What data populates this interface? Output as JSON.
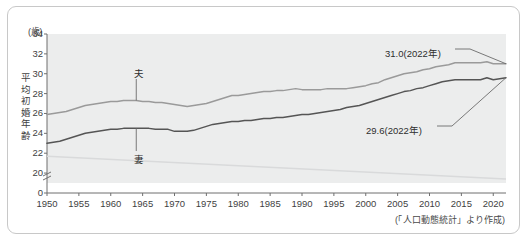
{
  "figure": {
    "unit_label": "(歳)",
    "y_axis_title_chars": [
      "平",
      "均",
      "初",
      "婚",
      "年",
      "齢"
    ],
    "source_note": "(「人口動態統計」より作成)"
  },
  "annotations": {
    "husband_end": "31.0(2022年)",
    "wife_end": "29.6(2022年)",
    "husband_series": "夫",
    "wife_series": "妻"
  },
  "colors": {
    "plot_background": "#eceded",
    "husband_line": "#9a9a9a",
    "wife_line": "#555555",
    "faint_line": "#d9dadb",
    "axis": "#6f6f6f",
    "frame": "#c8c8c8",
    "text": "#3a3a3a"
  },
  "chart_data": {
    "type": "line",
    "title": "",
    "subtitle": "",
    "xlabel": "",
    "ylabel": "平均初婚年齢",
    "yunit": "歳",
    "xlim": [
      1950,
      2022
    ],
    "ylim": [
      19,
      34
    ],
    "y_axis_break": true,
    "y_axis_break_between": [
      0,
      20
    ],
    "grid": false,
    "legend_position": "inline-labels",
    "ytick_labels": [
      "0",
      "20",
      "22",
      "24",
      "26",
      "28",
      "30",
      "32",
      "34"
    ],
    "yticks": [
      0,
      20,
      22,
      24,
      26,
      28,
      30,
      32,
      34
    ],
    "xtick_labels": [
      "1950",
      "1955",
      "1960",
      "1965",
      "1970",
      "1975",
      "1980",
      "1985",
      "1990",
      "1995",
      "2000",
      "2005",
      "2010",
      "2015",
      "2020"
    ],
    "xticks": [
      1950,
      1955,
      1960,
      1965,
      1970,
      1975,
      1980,
      1985,
      1990,
      1995,
      2000,
      2005,
      2010,
      2015,
      2020
    ],
    "x": [
      1950,
      1951,
      1952,
      1953,
      1954,
      1955,
      1956,
      1957,
      1958,
      1959,
      1960,
      1961,
      1962,
      1963,
      1964,
      1965,
      1966,
      1967,
      1968,
      1969,
      1970,
      1971,
      1972,
      1973,
      1974,
      1975,
      1976,
      1977,
      1978,
      1979,
      1980,
      1981,
      1982,
      1983,
      1984,
      1985,
      1986,
      1987,
      1988,
      1989,
      1990,
      1991,
      1992,
      1993,
      1994,
      1995,
      1996,
      1997,
      1998,
      1999,
      2000,
      2001,
      2002,
      2003,
      2004,
      2005,
      2006,
      2007,
      2008,
      2009,
      2010,
      2011,
      2012,
      2013,
      2014,
      2015,
      2016,
      2017,
      2018,
      2019,
      2020,
      2021,
      2022
    ],
    "series": [
      {
        "name": "夫",
        "label": "夫",
        "color": "#9a9a9a",
        "end_value": 31.0,
        "end_label": "31.0(2022年)",
        "values": [
          25.9,
          26.0,
          26.1,
          26.2,
          26.4,
          26.6,
          26.8,
          26.9,
          27.0,
          27.1,
          27.2,
          27.2,
          27.3,
          27.3,
          27.3,
          27.2,
          27.2,
          27.1,
          27.1,
          27.0,
          26.9,
          26.8,
          26.7,
          26.8,
          26.9,
          27.0,
          27.2,
          27.4,
          27.6,
          27.8,
          27.8,
          27.9,
          28.0,
          28.1,
          28.2,
          28.2,
          28.3,
          28.3,
          28.4,
          28.5,
          28.4,
          28.4,
          28.4,
          28.4,
          28.5,
          28.5,
          28.5,
          28.5,
          28.6,
          28.7,
          28.8,
          29.0,
          29.1,
          29.4,
          29.6,
          29.8,
          30.0,
          30.1,
          30.2,
          30.4,
          30.5,
          30.7,
          30.8,
          30.9,
          31.1,
          31.1,
          31.1,
          31.1,
          31.1,
          31.2,
          31.0,
          31.0,
          31.0
        ]
      },
      {
        "name": "妻",
        "label": "妻",
        "color": "#555555",
        "end_value": 29.6,
        "end_label": "29.6(2022年)",
        "values": [
          23.0,
          23.1,
          23.2,
          23.4,
          23.6,
          23.8,
          24.0,
          24.1,
          24.2,
          24.3,
          24.4,
          24.4,
          24.5,
          24.5,
          24.5,
          24.5,
          24.5,
          24.4,
          24.4,
          24.4,
          24.2,
          24.2,
          24.2,
          24.3,
          24.5,
          24.7,
          24.9,
          25.0,
          25.1,
          25.2,
          25.2,
          25.3,
          25.3,
          25.4,
          25.5,
          25.5,
          25.6,
          25.6,
          25.7,
          25.8,
          25.9,
          25.9,
          26.0,
          26.1,
          26.2,
          26.3,
          26.4,
          26.6,
          26.7,
          26.8,
          27.0,
          27.2,
          27.4,
          27.6,
          27.8,
          28.0,
          28.2,
          28.3,
          28.5,
          28.6,
          28.8,
          29.0,
          29.2,
          29.3,
          29.4,
          29.4,
          29.4,
          29.4,
          29.4,
          29.6,
          29.4,
          29.5,
          29.6
        ]
      }
    ]
  }
}
